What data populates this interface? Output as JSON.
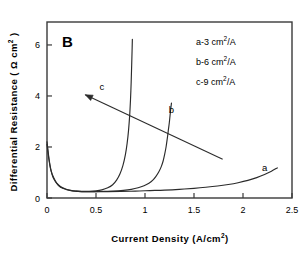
{
  "panel": {
    "label": "B"
  },
  "axes": {
    "x": {
      "title_main": "Current Density (A/cm",
      "title_sup": "2",
      "title_tail": ")",
      "ticks": [
        "0",
        "0.5",
        "1",
        "1.5",
        "2",
        "2.5"
      ],
      "tick_values": [
        0,
        0.5,
        1,
        1.5,
        2,
        2.5
      ],
      "min": 0,
      "max": 2.5
    },
    "y": {
      "title_main": "Differential Resistance ( ",
      "title_omega": "Ω",
      "title_unit": " cm",
      "title_sup": "2",
      "title_tail": " )",
      "ticks": [
        "0",
        "2",
        "4",
        "6"
      ],
      "tick_values": [
        0,
        2,
        4,
        6
      ],
      "min": 0,
      "max": 6.9
    }
  },
  "legend": {
    "entries": [
      {
        "prefix": "a-3 cm",
        "sup": "2",
        "suffix": "/A"
      },
      {
        "prefix": "b-6 cm",
        "sup": "2",
        "suffix": "/A"
      },
      {
        "prefix": "c-9 cm",
        "sup": "2",
        "suffix": "/A"
      }
    ]
  },
  "curve_labels": {
    "a": "a",
    "b": "b",
    "c": "c"
  },
  "colors": {
    "axis": "#3a3a3a",
    "curve": "#2b2b2b",
    "arrow": "#2b2b2b",
    "text": "#000000"
  },
  "chart_data": {
    "type": "line",
    "title": "B",
    "xlabel": "Current Density (A/cm2)",
    "ylabel": "Differential Resistance (Ω cm2)",
    "xlim": [
      0,
      2.5
    ],
    "ylim": [
      0,
      6.9
    ],
    "grid": false,
    "legend_position": "top-right",
    "annotations": [
      {
        "type": "arrow",
        "text": "c",
        "from": [
          1.22,
          2.55
        ],
        "to": [
          0.39,
          4.05
        ],
        "note": "arrow pointing up-left across curves toward increasing c"
      },
      {
        "type": "curve-label",
        "text": "a",
        "at": [
          2.22,
          1.05
        ]
      },
      {
        "type": "curve-label",
        "text": "b",
        "at": [
          1.27,
          3.35
        ]
      },
      {
        "type": "curve-label",
        "text": "c",
        "at": [
          0.56,
          4.25
        ]
      }
    ],
    "series": [
      {
        "name": "a-3 cm2/A",
        "label": "a",
        "x": [
          0.0,
          0.02,
          0.04,
          0.06,
          0.09,
          0.12,
          0.16,
          0.2,
          0.26,
          0.32,
          0.4,
          0.5,
          0.62,
          0.75,
          0.9,
          1.05,
          1.2,
          1.35,
          1.5,
          1.62,
          1.74,
          1.85,
          1.95,
          2.05,
          2.14,
          2.22,
          2.29,
          2.35
        ],
        "y": [
          2.2,
          1.55,
          1.1,
          0.82,
          0.62,
          0.48,
          0.38,
          0.33,
          0.28,
          0.26,
          0.25,
          0.25,
          0.25,
          0.26,
          0.27,
          0.29,
          0.31,
          0.34,
          0.38,
          0.42,
          0.47,
          0.53,
          0.6,
          0.69,
          0.8,
          0.92,
          1.05,
          1.18
        ]
      },
      {
        "name": "b-6 cm2/A",
        "label": "b",
        "x": [
          0.3,
          0.38,
          0.48,
          0.58,
          0.68,
          0.78,
          0.86,
          0.93,
          0.99,
          1.04,
          1.08,
          1.11,
          1.14,
          1.165,
          1.185,
          1.2,
          1.215,
          1.228,
          1.238,
          1.248,
          1.256,
          1.263,
          1.27
        ],
        "y": [
          0.26,
          0.25,
          0.25,
          0.26,
          0.27,
          0.3,
          0.34,
          0.4,
          0.48,
          0.58,
          0.7,
          0.84,
          1.02,
          1.22,
          1.45,
          1.7,
          2.0,
          2.35,
          2.65,
          2.95,
          3.25,
          3.5,
          3.72
        ]
      },
      {
        "name": "c-9 cm2/A",
        "label": "c",
        "x": [
          0.0,
          0.02,
          0.04,
          0.07,
          0.1,
          0.14,
          0.19,
          0.24,
          0.3,
          0.36,
          0.43,
          0.5,
          0.56,
          0.62,
          0.67,
          0.71,
          0.745,
          0.775,
          0.8,
          0.818,
          0.832,
          0.843,
          0.852,
          0.859,
          0.864,
          0.868,
          0.871
        ],
        "y": [
          2.1,
          1.5,
          1.08,
          0.78,
          0.58,
          0.44,
          0.35,
          0.3,
          0.27,
          0.26,
          0.26,
          0.28,
          0.32,
          0.4,
          0.52,
          0.7,
          0.95,
          1.28,
          1.7,
          2.15,
          2.65,
          3.2,
          3.85,
          4.55,
          5.2,
          5.75,
          6.22
        ]
      }
    ]
  }
}
